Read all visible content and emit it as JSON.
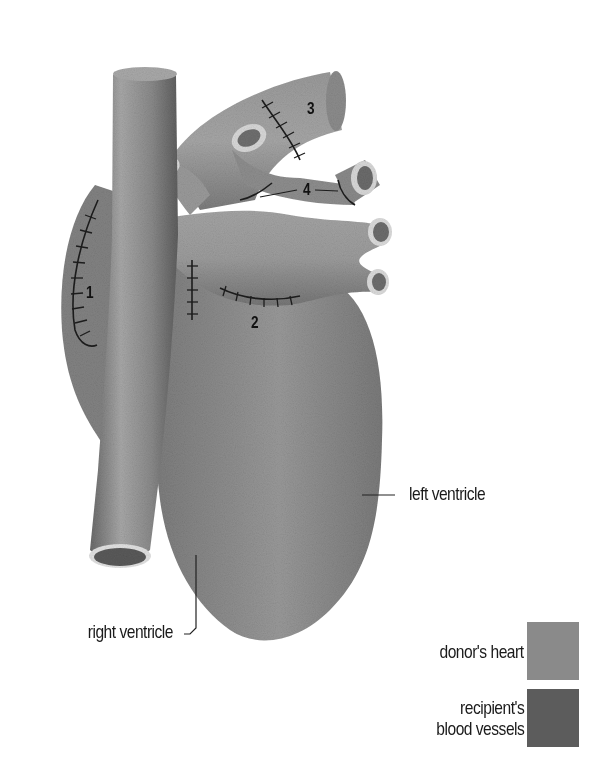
{
  "diagram": {
    "suture_labels": [
      "1",
      "2",
      "3",
      "4"
    ],
    "labels": {
      "left_ventricle": "left ventricle",
      "right_ventricle": "right ventricle"
    },
    "legend": [
      {
        "label": "donor's heart",
        "color": "#8a8a8a"
      },
      {
        "label_line1": "recipient's",
        "label_line2": "blood vessels",
        "color": "#5c5c5c"
      }
    ],
    "caption_partial": "(cut off, illegible)"
  },
  "colors": {
    "background": "#ffffff",
    "donor_tissue": "#8e8e8e",
    "recipient_vessels": "#6a6a6a",
    "vessel_highlight": "#b5b5b5",
    "suture": "#1e1e1e",
    "text": "#1a1a1a"
  }
}
